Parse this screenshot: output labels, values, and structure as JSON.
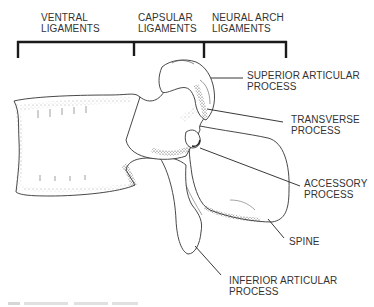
{
  "diagram": {
    "header_groups": [
      {
        "line1": "VENTRAL",
        "line2": "LIGAMENTS"
      },
      {
        "line1": "CAPSULAR",
        "line2": "LIGAMENTS"
      },
      {
        "line1": "NEURAL ARCH",
        "line2": "LIGAMENTS"
      }
    ],
    "labels": [
      {
        "line1": "SUPERIOR ARTICULAR",
        "line2": "PROCESS"
      },
      {
        "line1": "TRANSVERSE",
        "line2": "PROCESS"
      },
      {
        "line1": "ACCESSORY",
        "line2": "PROCESS"
      },
      {
        "line1": "SPINE",
        "line2": ""
      },
      {
        "line1": "INFERIOR ARTICULAR",
        "line2": "PROCESS"
      }
    ],
    "colors": {
      "ink": "#2a2a2a",
      "bracket": "#1a1a1a",
      "background": "#ffffff"
    }
  }
}
